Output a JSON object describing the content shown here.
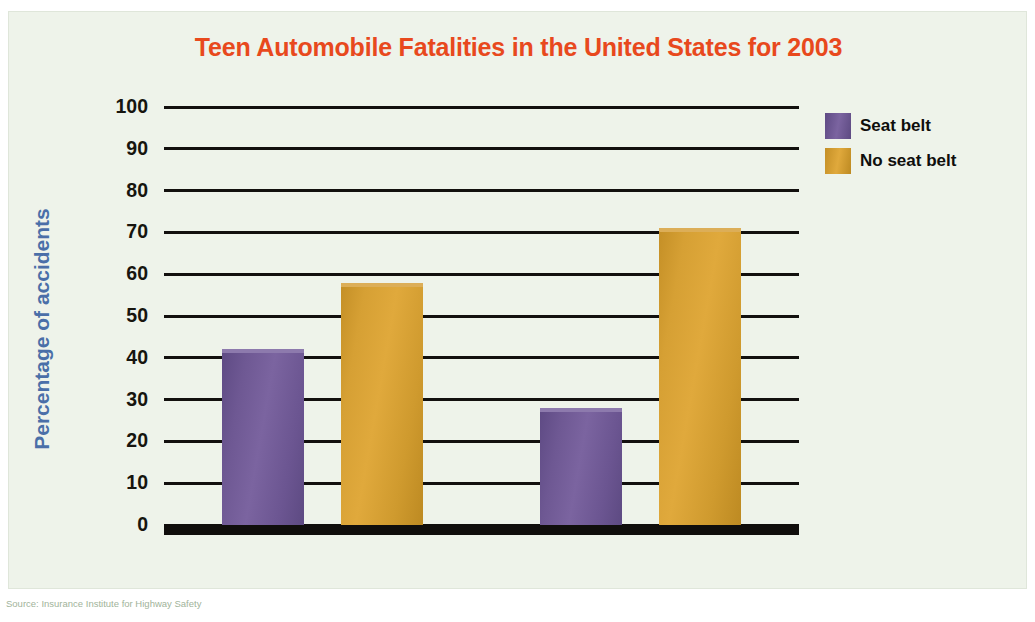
{
  "chart_data": {
    "type": "bar",
    "title": "Teen Automobile Fatalities in the United States for 2003",
    "xlabel": "",
    "ylabel": "Percentage of accidents",
    "categories": [
      "Drivers",
      "Passengers"
    ],
    "series": [
      {
        "name": "Seat belt",
        "color": "#6b5591",
        "values": [
          42,
          28
        ]
      },
      {
        "name": "No seat belt",
        "color": "#d09a2e",
        "values": [
          58,
          71
        ]
      }
    ],
    "ylim": [
      0,
      100
    ],
    "yticks": [
      0,
      10,
      20,
      30,
      40,
      50,
      60,
      70,
      80,
      90,
      100
    ],
    "ytick_labels": [
      "0",
      "10",
      "20",
      "30",
      "40",
      "50",
      "60",
      "70",
      "80",
      "90",
      "100"
    ],
    "grid": true,
    "legend_position": "right-top"
  },
  "figure": {
    "title": "Teen Automobile Fatalities in the United States for 2003",
    "title_color": "#e8491d",
    "y_axis_title": "Percentage of accidents",
    "y_axis_title_color": "#4a6fa8",
    "panel_background": "#eef3ea",
    "source_note": "Source: Insurance Institute for Highway Safety"
  },
  "legend": {
    "items": [
      {
        "label": "Seat belt",
        "color": "#6b5591"
      },
      {
        "label": "No seat belt",
        "color": "#d09a2e"
      }
    ]
  }
}
